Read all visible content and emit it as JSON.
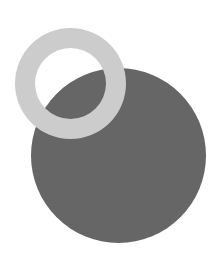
{
  "canvas": {
    "width": 221,
    "height": 253,
    "background": "#ffffff"
  },
  "shapes": {
    "large_circle": {
      "cx": 118.5,
      "cy": 155.5,
      "r": 87.5,
      "fill": "#666666"
    },
    "ring": {
      "cx": 70.5,
      "cy": 83.5,
      "outer_r": 55.5,
      "inner_r": 35.5,
      "fill": "#cccccc"
    }
  }
}
